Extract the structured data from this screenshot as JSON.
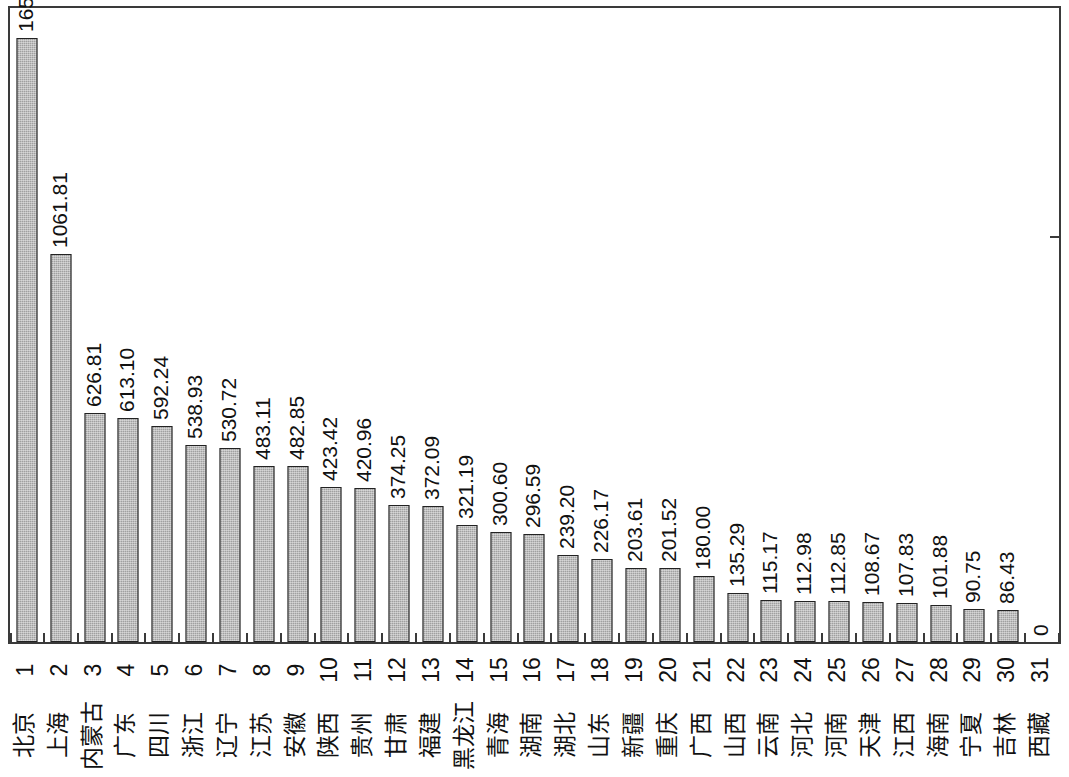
{
  "chart_data": {
    "type": "bar",
    "title": "",
    "subtitle": "",
    "xlabel": "",
    "ylabel": "",
    "grid": false,
    "legend": null,
    "ylim": [
      0,
      1800
    ],
    "orientation": "vertical",
    "bar_color": "#a0a0a0",
    "bar_edge_color": "#222222",
    "label_rotation_deg": 90,
    "categories": [
      "北京",
      "上海",
      "内蒙古",
      "广东",
      "四川",
      "浙江",
      "辽宁",
      "江苏",
      "安徽",
      "陕西",
      "贵州",
      "甘肃",
      "福建",
      "黑龙江",
      "青海",
      "湖南",
      "湖北",
      "山东",
      "新疆",
      "重庆",
      "广西",
      "山西",
      "云南",
      "河北",
      "河南",
      "天津",
      "江西",
      "海南",
      "宁夏",
      "吉林",
      "西藏"
    ],
    "indices": [
      "1",
      "2",
      "3",
      "4",
      "5",
      "6",
      "7",
      "8",
      "9",
      "10",
      "11",
      "12",
      "13",
      "14",
      "15",
      "16",
      "17",
      "18",
      "19",
      "20",
      "21",
      "22",
      "23",
      "24",
      "25",
      "26",
      "27",
      "28",
      "29",
      "30",
      "31"
    ],
    "values": [
      1654.97,
      1061.81,
      626.81,
      613.1,
      592.24,
      538.93,
      530.72,
      483.11,
      482.85,
      423.42,
      420.96,
      374.25,
      372.09,
      321.19,
      300.6,
      296.59,
      239.2,
      226.17,
      203.61,
      201.52,
      180.0,
      135.29,
      115.17,
      112.98,
      112.85,
      108.67,
      107.83,
      101.88,
      90.75,
      86.43,
      0
    ],
    "value_labels": [
      "1654.97",
      "1061.81",
      "626.81",
      "613.10",
      "592.24",
      "538.93",
      "530.72",
      "483.11",
      "482.85",
      "423.42",
      "420.96",
      "374.25",
      "372.09",
      "321.19",
      "300.60",
      "296.59",
      "239.20",
      "226.17",
      "203.61",
      "201.52",
      "180.00",
      "135.29",
      "115.17",
      "112.98",
      "112.85",
      "108.67",
      "107.83",
      "101.88",
      "90.75",
      "86.43",
      "0"
    ]
  }
}
